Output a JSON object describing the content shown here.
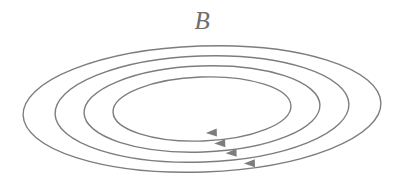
{
  "figure": {
    "background_color": "#ffffff",
    "width": 405,
    "height": 189
  },
  "label": {
    "text": "B",
    "meaning": "magnetic field vector label",
    "color": "#6e6e6e",
    "font_style": "italic-serif",
    "font_size_px": 25,
    "center_x": 202,
    "center_y": 21
  },
  "chart_data": {
    "type": "diagram",
    "title": "B",
    "subtitle": "",
    "xlabel": "",
    "ylabel": "",
    "stroke_color": "#7d7d7d",
    "stroke_width": 1.4,
    "fill": "none",
    "common_center": {
      "x": 202,
      "y": 109
    },
    "rotation_deg": -2,
    "arrow_direction": "left",
    "circulation": "clockwise-viewed-from-above",
    "loop_count": 4,
    "loops": [
      {
        "index": 1,
        "name": "innermost-loop",
        "rx": 89,
        "ry": 32,
        "left_edge_x": 113,
        "right_edge_x": 291,
        "top_edge_y": 77,
        "bottom_edge_y": 141,
        "arrow_x": 205,
        "arrow_y": 133
      },
      {
        "index": 2,
        "name": "second-loop",
        "rx": 118,
        "ry": 43,
        "left_edge_x": 84,
        "right_edge_x": 320,
        "top_edge_y": 66,
        "bottom_edge_y": 152,
        "arrow_x": 213,
        "arrow_y": 144
      },
      {
        "index": 3,
        "name": "third-loop",
        "rx": 147,
        "ry": 53,
        "left_edge_x": 55,
        "right_edge_x": 349,
        "top_edge_y": 56,
        "bottom_edge_y": 162,
        "arrow_x": 224,
        "arrow_y": 154
      },
      {
        "index": 4,
        "name": "outermost-loop",
        "rx": 179,
        "ry": 63,
        "left_edge_x": 23,
        "right_edge_x": 381,
        "top_edge_y": 46,
        "bottom_edge_y": 172,
        "arrow_x": 242,
        "arrow_y": 165
      }
    ],
    "arrowhead": {
      "shape": "solid-triangle",
      "length": 11,
      "half_width": 4,
      "color": "#7d7d7d"
    }
  }
}
